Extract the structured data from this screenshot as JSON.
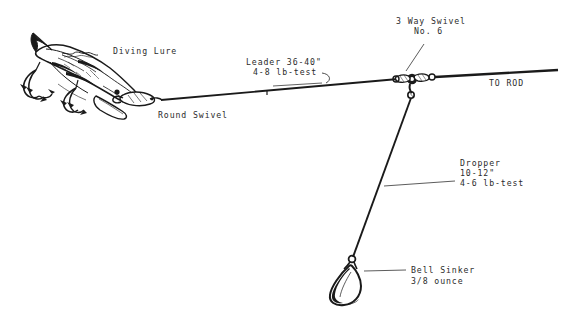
{
  "document": {
    "title": "Fishing Rig Diagram",
    "type": "line-art technical illustration",
    "background_color": "#ffffff",
    "ink_color": "#1a1a1a",
    "text_color": "#2b2b2b"
  },
  "labels": {
    "diving_lure": "Diving Lure",
    "round_swivel": "Round Swivel",
    "leader_line1": "Leader 36-40\"",
    "leader_line2": "4-8 lb-test",
    "swivel3_line1": "3 Way Swivel",
    "swivel3_line2": "No. 6",
    "to_rod": "TO ROD",
    "dropper_line1": "Dropper",
    "dropper_line2": "10-12\"",
    "dropper_line3": "4-6 lb-test",
    "sinker_line1": "Bell Sinker",
    "sinker_line2": "3/8 ounce"
  },
  "components": {
    "diving_lure": {
      "name": "diving-lure",
      "description": "fish-shaped diving plug with diving lip and two treble hooks"
    },
    "round_swivel": {
      "name": "round-swivel",
      "description": "small barrel swivel joining lure to leader"
    },
    "three_way_swivel": {
      "name": "three-way-swivel",
      "description": "Y-shaped three-way swivel with three eyes",
      "size": "No. 6"
    },
    "bell_sinker": {
      "name": "bell-sinker",
      "description": "teardrop bell sinker with wire eye",
      "weight": "3/8 ounce"
    }
  },
  "lines": {
    "leader": {
      "name": "leader-line",
      "length": "36-40\"",
      "test": "4-8 lb-test"
    },
    "dropper": {
      "name": "dropper-line",
      "length": "10-12\"",
      "test": "4-6 lb-test"
    },
    "main": {
      "name": "main-line-to-rod",
      "destination": "TO ROD"
    }
  }
}
